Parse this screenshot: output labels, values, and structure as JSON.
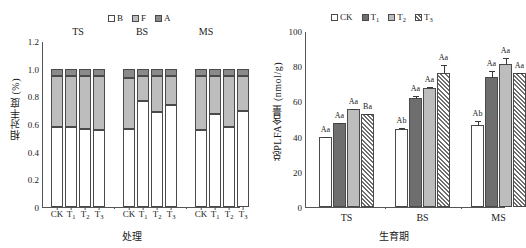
{
  "figure": {
    "panels": [
      "left-stacked-relative-abundance",
      "right-grouped-total-plfa"
    ]
  },
  "left": {
    "ylabel": "相对丰度 (%)",
    "xlabel": "处理",
    "legend": [
      {
        "label": "B",
        "fill": "#ffffff",
        "key": "bacteria"
      },
      {
        "label": "F",
        "fill": "#bdbdbd",
        "key": "fungi"
      },
      {
        "label": "A",
        "fill": "#8a8a8a",
        "key": "actinomycetes"
      }
    ],
    "yticks": [
      "0",
      "0.2",
      "0.4",
      "0.6",
      "0.8",
      "1.0",
      "1.2"
    ],
    "groups": [
      "TS",
      "BS",
      "MS"
    ],
    "treatments": [
      "CK",
      "T",
      "T",
      "T"
    ],
    "treatment_subs": [
      "",
      "1",
      "2",
      "3"
    ]
  },
  "right": {
    "ylabel": "总PLFA含量 (nmol/g)",
    "xlabel": "生育期",
    "legend": [
      {
        "label": "CK",
        "sub": "",
        "fill": "#ffffff"
      },
      {
        "label": "T",
        "sub": "1",
        "fill": "#6e6e6e"
      },
      {
        "label": "T",
        "sub": "2",
        "fill": "#bdbdbd"
      },
      {
        "label": "T",
        "sub": "3",
        "fill": "hatch"
      }
    ],
    "yticks": [
      "0",
      "20",
      "40",
      "60",
      "80",
      "100"
    ],
    "groups": [
      "TS",
      "BS",
      "MS"
    ]
  },
  "chart_data": [
    {
      "type": "bar",
      "subtype": "stacked",
      "panel": "left",
      "title": "",
      "xlabel": "处理",
      "ylabel": "相对丰度 (%)",
      "ylim": [
        0,
        1.2
      ],
      "yticks": [
        0,
        0.2,
        0.4,
        0.6,
        0.8,
        1.0,
        1.2
      ],
      "grid": false,
      "legend_position": "top-center",
      "group_labels": [
        "TS",
        "BS",
        "MS"
      ],
      "categories": [
        "TS-CK",
        "TS-T1",
        "TS-T2",
        "TS-T3",
        "BS-CK",
        "BS-T1",
        "BS-T2",
        "BS-T3",
        "MS-CK",
        "MS-T1",
        "MS-T2",
        "MS-T3"
      ],
      "series": [
        {
          "name": "B",
          "fill": "#ffffff",
          "values": [
            0.58,
            0.58,
            0.565,
            0.555,
            0.565,
            0.765,
            0.69,
            0.735,
            0.555,
            0.675,
            0.575,
            0.695
          ]
        },
        {
          "name": "F",
          "fill": "#bdbdbd",
          "values": [
            0.365,
            0.365,
            0.38,
            0.39,
            0.365,
            0.18,
            0.255,
            0.21,
            0.39,
            0.27,
            0.37,
            0.25
          ]
        },
        {
          "name": "A",
          "fill": "#8a8a8a",
          "values": [
            0.055,
            0.055,
            0.055,
            0.055,
            0.07,
            0.055,
            0.055,
            0.055,
            0.055,
            0.055,
            0.055,
            0.055
          ]
        }
      ],
      "stack_tops": {
        "B": [
          0.58,
          0.58,
          0.565,
          0.555,
          0.565,
          0.765,
          0.69,
          0.735,
          0.555,
          0.675,
          0.575,
          0.695
        ],
        "BF": [
          0.945,
          0.945,
          0.945,
          0.945,
          0.93,
          0.945,
          0.945,
          0.945,
          0.945,
          0.945,
          0.945,
          0.945
        ],
        "BFA": [
          1.0,
          1.0,
          1.0,
          1.0,
          1.0,
          1.0,
          1.0,
          1.0,
          1.0,
          1.0,
          1.0,
          1.0
        ]
      }
    },
    {
      "type": "bar",
      "subtype": "grouped",
      "panel": "right",
      "title": "",
      "xlabel": "生育期",
      "ylabel": "总PLFA含量 (nmol/g)",
      "ylim": [
        0,
        100
      ],
      "yticks": [
        0,
        20,
        40,
        60,
        80,
        100
      ],
      "grid": false,
      "legend_position": "top-center",
      "categories": [
        "TS",
        "BS",
        "MS"
      ],
      "series": [
        {
          "name": "CK",
          "fill": "#ffffff",
          "values": [
            39.5,
            44.5,
            46.5
          ],
          "errors": [
            1.0,
            0.8,
            3.0
          ],
          "annotations": [
            "Aa",
            "Ab",
            "Ab"
          ]
        },
        {
          "name": "T1",
          "fill": "#6e6e6e",
          "values": [
            47.5,
            62.0,
            74.0
          ],
          "errors": [
            0.9,
            1.5,
            4.0
          ],
          "annotations": [
            "Aa",
            "Aa",
            "Aa"
          ]
        },
        {
          "name": "T2",
          "fill": "#bdbdbd",
          "values": [
            55.5,
            67.5,
            81.0
          ],
          "errors": [
            0.8,
            1.2,
            4.5
          ],
          "annotations": [
            "Aa",
            "Aa",
            "Aa"
          ]
        },
        {
          "name": "T3",
          "fill": "hatch",
          "values": [
            53.0,
            76.0,
            76.0
          ],
          "errors": [
            0.6,
            5.5,
            0.6
          ],
          "annotations": [
            "Ba",
            "Aa",
            "Aa"
          ]
        }
      ]
    }
  ]
}
